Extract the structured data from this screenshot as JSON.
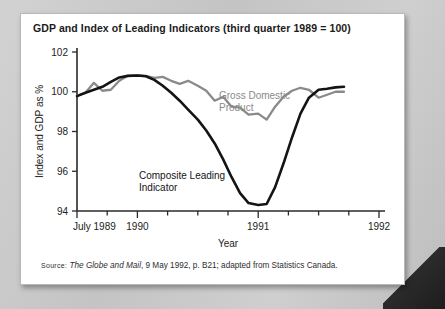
{
  "card": {
    "title": "GDP and Index of Leading Indicators (third quarter 1989 = 100)",
    "source_prefix": "Source:",
    "source_italic": "The Globe and Mail",
    "source_rest": ", 9 May 1992, p. B21; adapted from Statistics Canada."
  },
  "chart_data": {
    "type": "line",
    "title": "GDP and Index of Leading Indicators (third quarter 1989 = 100)",
    "xlabel": "Year",
    "ylabel": "Index and GDP as %",
    "ylim": [
      94,
      102
    ],
    "yticks": [
      94,
      96,
      98,
      100,
      102
    ],
    "ytick_labels": [
      "94",
      "96",
      "98",
      "100",
      "102"
    ],
    "xlim": [
      1989.5,
      1992.0
    ],
    "xtick_labels": [
      "July 1989",
      "1990",
      "1991",
      "1992"
    ],
    "xtick_values": [
      1989.5,
      1990.0,
      1991.0,
      1992.0
    ],
    "minor_xticks": [
      1989.75,
      1990.25,
      1990.5,
      1990.75,
      1991.25,
      1991.5,
      1991.75
    ],
    "grid": false,
    "legend": "inline-labels",
    "colors": {
      "gdp": "#8a8a8a",
      "cli": "#141414",
      "axis": "#2a2a2a"
    },
    "series": [
      {
        "name": "Gross Domestic Product",
        "label": "Gross Domestic\nProduct",
        "label_line1": "Gross Domestic",
        "label_line2": "Product",
        "color": "#8a8a8a",
        "x": [
          1989.5,
          1989.57,
          1989.64,
          1989.71,
          1989.78,
          1989.85,
          1989.92,
          1990.0,
          1990.07,
          1990.14,
          1990.21,
          1990.28,
          1990.35,
          1990.42,
          1990.5,
          1990.57,
          1990.64,
          1990.71,
          1990.78,
          1990.85,
          1990.92,
          1991.0,
          1991.07,
          1991.14,
          1991.21,
          1991.28,
          1991.35,
          1991.42,
          1991.5,
          1991.57,
          1991.64,
          1991.71
        ],
        "values": [
          99.8,
          99.95,
          100.45,
          100.05,
          100.1,
          100.55,
          100.8,
          100.82,
          100.8,
          100.7,
          100.75,
          100.55,
          100.4,
          100.55,
          100.3,
          100.05,
          99.55,
          99.75,
          99.25,
          99.2,
          98.85,
          98.9,
          98.6,
          99.25,
          99.75,
          100.05,
          100.2,
          100.1,
          99.7,
          99.85,
          100.0,
          100.0
        ]
      },
      {
        "name": "Composite Leading Indicator",
        "label": "Composite Leading\nIndicator",
        "label_line1": "Composite Leading",
        "label_line2": "Indicator",
        "color": "#141414",
        "x": [
          1989.5,
          1989.57,
          1989.64,
          1989.71,
          1989.78,
          1989.85,
          1989.92,
          1990.0,
          1990.07,
          1990.14,
          1990.21,
          1990.28,
          1990.35,
          1990.42,
          1990.5,
          1990.57,
          1990.64,
          1990.71,
          1990.78,
          1990.85,
          1990.92,
          1991.0,
          1991.07,
          1991.14,
          1991.21,
          1991.28,
          1991.35,
          1991.42,
          1991.5,
          1991.57,
          1991.64,
          1991.71
        ],
        "values": [
          99.78,
          99.95,
          100.1,
          100.25,
          100.5,
          100.72,
          100.8,
          100.82,
          100.78,
          100.6,
          100.3,
          99.95,
          99.55,
          99.1,
          98.6,
          98.05,
          97.4,
          96.6,
          95.7,
          94.9,
          94.4,
          94.3,
          94.35,
          95.2,
          96.4,
          97.7,
          98.9,
          99.7,
          100.1,
          100.15,
          100.22,
          100.25
        ]
      }
    ],
    "annotations": [
      {
        "text": "Gross Domestic Product",
        "color": "#8a8a8a"
      },
      {
        "text": "Composite Leading Indicator",
        "color": "#141414"
      }
    ]
  }
}
